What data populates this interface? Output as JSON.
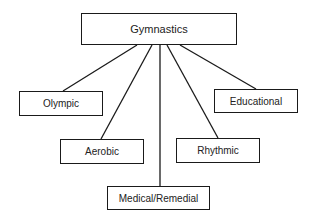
{
  "diagram": {
    "type": "tree",
    "root": {
      "id": "gymnastics",
      "label": "Gymnastics",
      "box": [
        81,
        13,
        156,
        32
      ]
    },
    "children": [
      {
        "id": "olympic",
        "label": "Olympic",
        "box": [
          19,
          91,
          84,
          25
        ],
        "edge": [
          137,
          45,
          63,
          91
        ]
      },
      {
        "id": "aerobic",
        "label": "Aerobic",
        "box": [
          60,
          139,
          84,
          25
        ],
        "edge": [
          152,
          45,
          101,
          139
        ]
      },
      {
        "id": "medical",
        "label": "Medical/Remedial",
        "box": [
          107,
          186,
          103,
          24
        ],
        "edge": [
          160,
          45,
          160,
          186
        ]
      },
      {
        "id": "rhythmic",
        "label": "Rhythmic",
        "box": [
          176,
          138,
          84,
          25
        ],
        "edge": [
          167,
          45,
          218,
          138
        ]
      },
      {
        "id": "educational",
        "label": "Educational",
        "box": [
          214,
          89,
          84,
          24
        ],
        "edge": [
          180,
          45,
          256,
          89
        ]
      }
    ],
    "colors": {
      "line": "#1a1a1a",
      "text": "#222222",
      "background": "#ffffff"
    }
  }
}
